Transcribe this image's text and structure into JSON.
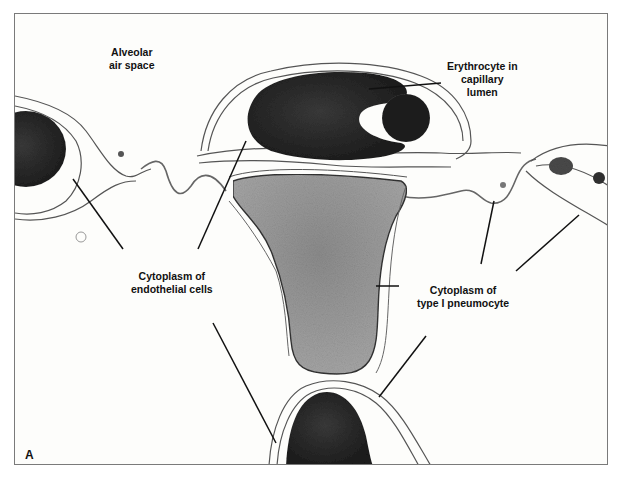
{
  "figure": {
    "panel_letter": "A",
    "labels": {
      "alveolar_air_space": {
        "line1": "Alveolar",
        "line2": "air space"
      },
      "erythrocyte": {
        "line1": "Erythrocyte in",
        "line2": "capillary",
        "line3": "lumen"
      },
      "endothelial": {
        "line1": "Cytoplasm of",
        "line2": "endothelial cells"
      },
      "pneumocyte": {
        "line1": "Cytoplasm of",
        "line2": "type I pneumocyte"
      }
    },
    "colors": {
      "background": "#fdfdfb",
      "frame": "#7a7a7a",
      "erythrocyte": "#2b2b2b",
      "nucleus": "#9a9a9a",
      "membrane": "#555555",
      "leader_line": "#111111"
    }
  }
}
